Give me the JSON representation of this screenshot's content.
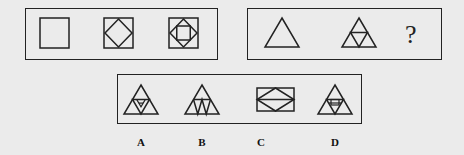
{
  "puzzle": {
    "row1": {
      "figures": [
        "square",
        "square-with-inscribed-diamond",
        "square-with-diamond-and-inner-square"
      ]
    },
    "row2": {
      "figures": [
        "triangle",
        "triangle-subdivided-into-four",
        "unknown"
      ],
      "question_mark": "?"
    },
    "options": [
      {
        "label": "A",
        "figure": "triangle-recursive-subdivision-variant-a"
      },
      {
        "label": "B",
        "figure": "triangle-with-zigzag-base"
      },
      {
        "label": "C",
        "figure": "rectangle-with-diamond-and-midline"
      },
      {
        "label": "D",
        "figure": "triangle-recursive-subdivision-variant-d"
      }
    ]
  },
  "colors": {
    "stroke": "#222222",
    "background": "#ebebeb"
  }
}
